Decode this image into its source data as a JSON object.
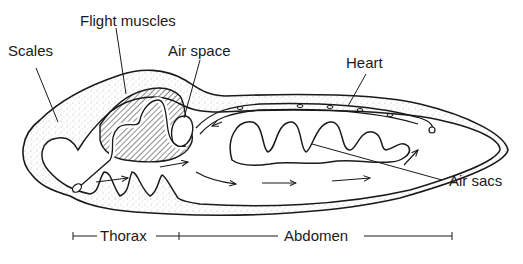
{
  "diagram": {
    "labels": {
      "scales": "Scales",
      "flight_muscles": "Flight muscles",
      "air_space": "Air space",
      "heart": "Heart",
      "air_sacs": "Air sacs"
    },
    "regions": {
      "thorax": "Thorax",
      "abdomen": "Abdomen"
    },
    "colors": {
      "ink": "#1a1a1a",
      "background": "#ffffff",
      "stipple": "#9a9a9a"
    }
  }
}
